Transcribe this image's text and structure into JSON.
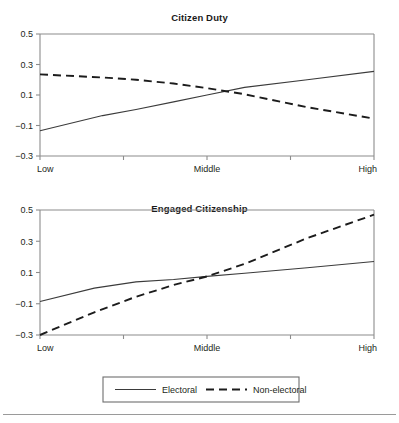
{
  "figure": {
    "background": "#ffffff",
    "line_color_solid": "#3b3b3b",
    "line_color_dashed": "#1c1c1c",
    "axis_color": "#8c8c8c",
    "footer_rule_y": 414
  },
  "legend": {
    "entries": [
      {
        "label": "Electoral",
        "style": "solid"
      },
      {
        "label": "Non-electoral",
        "style": "dashed"
      }
    ]
  },
  "chart_data": [
    {
      "type": "line",
      "title": "Citizen Duty",
      "xlabel": "",
      "ylabel": "",
      "x": [
        "Low",
        "",
        "Middle",
        "",
        "High"
      ],
      "xtick_labels": [
        "Low",
        "Middle",
        "High"
      ],
      "ytick_labels": [
        "0.5",
        "0.3",
        "0.1",
        "-0.1",
        "-0.3"
      ],
      "yticks": [
        0.5,
        0.3,
        0.1,
        -0.1,
        -0.3
      ],
      "ylim": [
        -0.3,
        0.5
      ],
      "xlim": [
        0,
        4
      ],
      "grid": false,
      "legend_position": "bottom-outside",
      "series": [
        {
          "name": "Electoral",
          "style": "solid",
          "values": [
            -0.135,
            -0.035,
            0.005,
            0.055,
            0.1,
            0.15,
            0.2,
            0.255
          ]
        },
        {
          "name": "Non-electoral",
          "style": "dashed",
          "values": [
            0.235,
            0.215,
            0.2,
            0.175,
            0.145,
            0.105,
            0.02,
            -0.055
          ]
        }
      ],
      "series_x": [
        0,
        0.75,
        1.15,
        1.6,
        2.0,
        2.45,
        3.2,
        4.0
      ]
    },
    {
      "type": "line",
      "title": "Engaged Citizenship",
      "xlabel": "",
      "ylabel": "",
      "x": [
        "Low",
        "",
        "Middle",
        "",
        "High"
      ],
      "xtick_labels": [
        "Low",
        "Middle",
        "High"
      ],
      "ytick_labels": [
        "0.5",
        "0.3",
        "0.1",
        "-0.1",
        "-0.3"
      ],
      "yticks": [
        0.5,
        0.3,
        0.1,
        -0.1,
        -0.3
      ],
      "ylim": [
        -0.3,
        0.5
      ],
      "xlim": [
        0,
        4
      ],
      "grid": false,
      "legend_position": "bottom-outside",
      "series": [
        {
          "name": "Electoral",
          "style": "solid",
          "values": [
            -0.085,
            0.0,
            0.04,
            0.055,
            0.075,
            0.095,
            0.13,
            0.17
          ]
        },
        {
          "name": "Non-electoral",
          "style": "dashed",
          "values": [
            -0.3,
            -0.155,
            -0.055,
            0.02,
            0.075,
            0.155,
            0.32,
            0.47
          ]
        }
      ],
      "series_x": [
        0,
        0.65,
        1.15,
        1.6,
        2.0,
        2.45,
        3.2,
        4.0
      ]
    }
  ]
}
